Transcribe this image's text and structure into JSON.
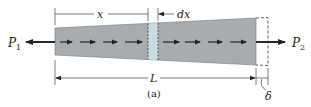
{
  "figure": {
    "caption": "(a)",
    "labels": {
      "p1": "P",
      "p1_sub": "1",
      "p2": "P",
      "p2_sub": "2",
      "x": "x",
      "dx": "dx",
      "L": "L",
      "delta": "δ"
    },
    "colors": {
      "bar_fill": "#a9acae",
      "element_fill": "#c9dde0",
      "line": "#222222",
      "background": "#ffffff"
    },
    "internal_arrows_left_count": 4,
    "internal_arrows_right_count": 4
  }
}
